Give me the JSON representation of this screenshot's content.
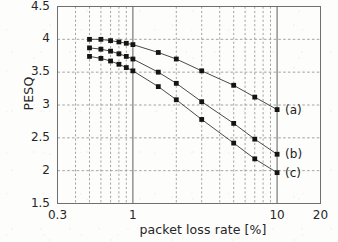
{
  "chart_data": {
    "type": "line",
    "title": "",
    "xlabel": "packet loss rate [%]",
    "ylabel": "PESQ",
    "xscale": "log",
    "xlim": [
      0.3,
      20
    ],
    "ylim": [
      1.5,
      4.5
    ],
    "xticks": [
      "0.3",
      "1",
      "10",
      "20"
    ],
    "xtick_values": [
      0.3,
      1,
      10,
      20
    ],
    "yticks": [
      "1.5",
      "2",
      "2.5",
      "3",
      "3.5",
      "4",
      "4.5"
    ],
    "ytick_values": [
      1.5,
      2,
      2.5,
      3,
      3.5,
      4,
      4.5
    ],
    "grid": true,
    "grid_style": "dashed minor log gridlines, solid decade lines at 1 and 10",
    "marker": "filled-square",
    "legend_position": "inline right end of each curve",
    "series": [
      {
        "name": "(a)",
        "label": "(a)",
        "x": [
          0.5,
          0.6,
          0.7,
          0.8,
          0.9,
          1.0,
          1.5,
          2.0,
          3.0,
          5.0,
          7.0,
          10.0
        ],
        "values": [
          4.0,
          4.0,
          3.98,
          3.96,
          3.94,
          3.92,
          3.8,
          3.7,
          3.52,
          3.3,
          3.12,
          2.93
        ]
      },
      {
        "name": "(b)",
        "label": "(b)",
        "x": [
          0.5,
          0.6,
          0.7,
          0.8,
          0.9,
          1.0,
          1.5,
          2.0,
          3.0,
          5.0,
          7.0,
          10.0
        ],
        "values": [
          3.87,
          3.85,
          3.82,
          3.78,
          3.74,
          3.7,
          3.5,
          3.33,
          3.05,
          2.72,
          2.48,
          2.25
        ]
      },
      {
        "name": "(c)",
        "label": "(c)",
        "x": [
          0.5,
          0.6,
          0.7,
          0.8,
          0.9,
          1.0,
          1.5,
          2.0,
          3.0,
          5.0,
          7.0,
          10.0
        ],
        "values": [
          3.74,
          3.71,
          3.67,
          3.62,
          3.57,
          3.52,
          3.28,
          3.08,
          2.78,
          2.42,
          2.18,
          1.97
        ]
      }
    ]
  },
  "axis": {
    "y_label": "PESQ",
    "x_label": "packet loss rate [%]"
  }
}
